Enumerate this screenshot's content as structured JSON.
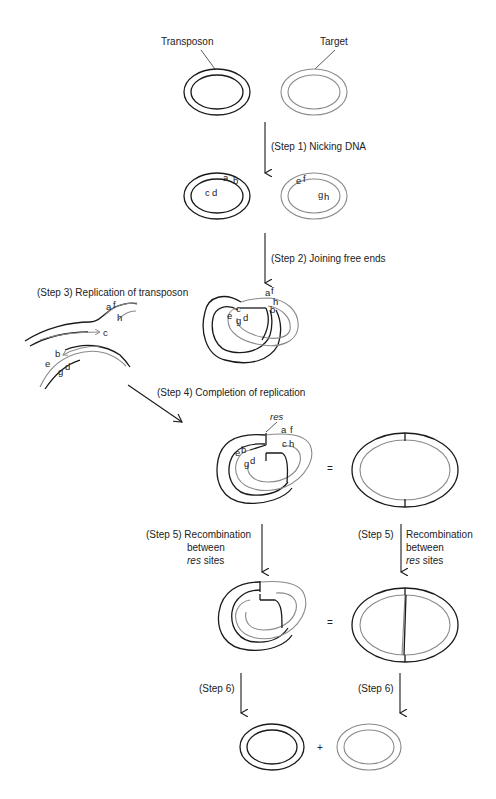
{
  "labels": {
    "transposon": "Transposon",
    "target": "Target",
    "step1": "(Step 1) Nicking DNA",
    "step2": "(Step 2) Joining free ends",
    "step3": "(Step 3) Replication of transposon",
    "step4": "(Step 4) Completion of replication",
    "step5_left_1": "(Step 5) Recombination",
    "step5_left_2": "between",
    "step5_left_3_italic": "res",
    "step5_left_3_rest": " sites",
    "step5_right_1": "(Step 5)",
    "step5_right_2": "Recombination",
    "step5_right_3": "between",
    "step5_right_4_italic": "res",
    "step5_right_4_rest": " sites",
    "step6_left": "(Step 6)",
    "step6_right": "(Step 6)",
    "res": "res",
    "equals1": "=",
    "equals2": "=",
    "plus": "+"
  },
  "strand_ends": {
    "step1_transposon": [
      "a",
      "b",
      "c",
      "d"
    ],
    "step1_target": [
      "e",
      "f",
      "g",
      "h"
    ],
    "step2": [
      "a",
      "f",
      "h",
      "b",
      "c",
      "e",
      "g",
      "d"
    ],
    "step3": [
      "a",
      "f",
      "h",
      "c",
      "b",
      "e",
      "g",
      "d"
    ],
    "step4": [
      "a",
      "f",
      "c",
      "h",
      "e",
      "b",
      "g",
      "d"
    ]
  },
  "colors": {
    "transposon_strand": "#1a1a1a",
    "target_strand": "#8a8a8a"
  }
}
